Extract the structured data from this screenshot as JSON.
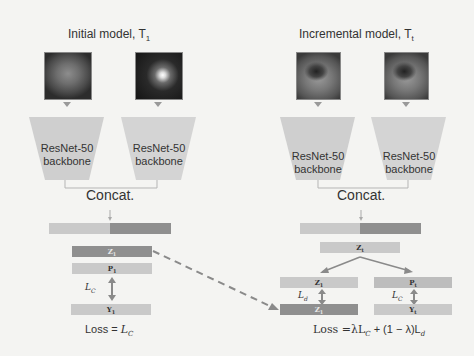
{
  "left_panel": {
    "title": "Initial model, T",
    "title_sub": "1",
    "images": [
      "ct-scan-image",
      "pet-scan-image"
    ],
    "backbones": [
      {
        "line1": "ResNet-50",
        "line2": "backbone"
      },
      {
        "line1": "ResNet-50",
        "line2": "backbone"
      }
    ],
    "concat_label": "Concat.",
    "bars": {
      "z": {
        "label": "Z",
        "sub": "1"
      },
      "p": {
        "label": "P",
        "sub": "1"
      },
      "y": {
        "label": "Y",
        "sub": "1"
      }
    },
    "loss_arrow_label": "L",
    "loss_arrow_sub": "C",
    "loss_prefix": "Loss = ",
    "loss_term": "L",
    "loss_term_sub": "C"
  },
  "right_panel": {
    "title": "Incremental model, T",
    "title_sub": "t",
    "images": [
      "ct-scan-image",
      "ct-scan-image"
    ],
    "backbones": [
      {
        "line1": "ResNet-50",
        "line2": "backbone"
      },
      {
        "line1": "ResNet-50",
        "line2": "backbone"
      }
    ],
    "concat_label": "Concat.",
    "bars": {
      "zt": {
        "label": "Z",
        "sub": "t"
      },
      "z1_pred": {
        "label": "Z",
        "sub": "1"
      },
      "pt": {
        "label": "P",
        "sub": "t"
      },
      "z1_target": {
        "label": "Z",
        "sub": "1"
      },
      "yt": {
        "label": "Y",
        "sub": "t"
      }
    },
    "distill_arrow_label": "L",
    "distill_arrow_sub": "d",
    "class_arrow_label": "L",
    "class_arrow_sub": "C",
    "loss_text": "Loss =λL",
    "loss_sub1": "C",
    "loss_mid": " + (1 − λ)L",
    "loss_sub2": "d"
  },
  "colors": {
    "background": "#f4f4f2",
    "trapezoid": "#cfcfcf",
    "bar_light": "#c9c9c9",
    "bar_dark": "#8f8f8f",
    "arrow": "#8a8a8a"
  }
}
